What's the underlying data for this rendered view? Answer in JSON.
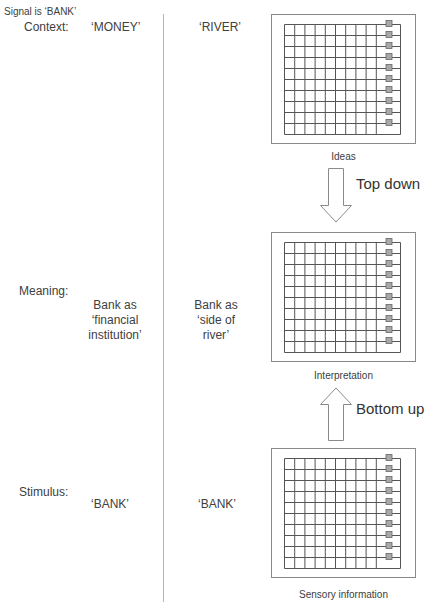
{
  "signal_label": "Signal is ‘BANK’",
  "rows": {
    "context": {
      "label": "Context:",
      "left": "‘MONEY’",
      "right": "‘RIVER’"
    },
    "meaning": {
      "label": "Meaning:",
      "left": [
        "Bank as",
        "‘financial",
        "institution’"
      ],
      "right": [
        "Bank as",
        "‘side of",
        "river’"
      ]
    },
    "stimulus": {
      "label": "Stimulus:",
      "left": "‘BANK’",
      "right": "‘BANK’"
    }
  },
  "panels": [
    {
      "label": "Ideas"
    },
    {
      "label": "Interpretation"
    },
    {
      "label": "Sensory information"
    }
  ],
  "arrows": {
    "top_down": "Top down",
    "bottom_up": "Bottom up"
  },
  "grid": {
    "rows": 10,
    "narrow_columns": 9,
    "markers": 10
  }
}
